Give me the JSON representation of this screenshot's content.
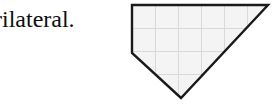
{
  "page": {
    "background_color": "#ffffff"
  },
  "caption": {
    "text": "rilateral.",
    "color": "#0f0f0f",
    "note_truncated_left": true
  },
  "figure": {
    "name": "grid-pentagon-shape",
    "fill_color": "#f4f4f4",
    "outline_color": "#1a1a1a",
    "outline_width": 2.4,
    "grid_color": "#d9d9d9",
    "grid_width": 1,
    "grid_cell_size": 23,
    "grid_origin": {
      "x": 132,
      "y": 5
    },
    "vertices": [
      {
        "x": 132,
        "y": 5
      },
      {
        "x": 268,
        "y": 5
      },
      {
        "x": 181,
        "y": 98
      },
      {
        "x": 132,
        "y": 53
      }
    ],
    "vertex_count": 4,
    "grid_vertical_lines": [
      155,
      178,
      201,
      224,
      247
    ],
    "grid_horizontal_lines": [
      28,
      51,
      74
    ]
  }
}
